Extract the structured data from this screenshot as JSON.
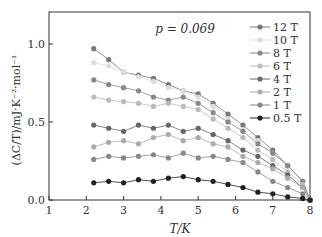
{
  "chart_data": {
    "type": "line",
    "title": "",
    "annotation": "p = 0.069",
    "xlabel": "T/K",
    "ylabel": "(ΔC/T)/mJ·K⁻²·mol⁻¹",
    "xlim": [
      1,
      8
    ],
    "ylim": [
      0,
      1.2
    ],
    "xticks": [
      "1",
      "2",
      "3",
      "4",
      "5",
      "6",
      "7",
      "8"
    ],
    "yticks": [
      "0.0",
      "0.5",
      "1.0"
    ],
    "legend_position": "upper right",
    "x": [
      2.2,
      2.6,
      3.0,
      3.4,
      3.8,
      4.2,
      4.6,
      5.0,
      5.4,
      5.8,
      6.2,
      6.6,
      7.0,
      7.4,
      7.8,
      8.0
    ],
    "series": [
      {
        "name": "12 T",
        "color": "#777777",
        "marker": "circle",
        "values": [
          0.97,
          0.9,
          0.82,
          0.8,
          0.78,
          0.74,
          0.7,
          0.68,
          0.62,
          0.55,
          0.48,
          0.4,
          0.32,
          0.22,
          0.12,
          0.0
        ]
      },
      {
        "name": "10 T",
        "color": "#dddddd",
        "marker": "tri-right",
        "values": [
          0.88,
          0.86,
          0.82,
          0.79,
          0.76,
          0.72,
          0.7,
          0.66,
          0.6,
          0.52,
          0.45,
          0.38,
          0.3,
          0.22,
          0.12,
          0.0
        ]
      },
      {
        "name": "8 T",
        "color": "#888888",
        "marker": "tri-left",
        "values": [
          0.77,
          0.74,
          0.72,
          0.7,
          0.66,
          0.64,
          0.66,
          0.62,
          0.56,
          0.5,
          0.44,
          0.36,
          0.3,
          0.22,
          0.12,
          0.0
        ]
      },
      {
        "name": "6 T",
        "color": "#bbbbbb",
        "marker": "diamond",
        "values": [
          0.66,
          0.64,
          0.63,
          0.62,
          0.6,
          0.62,
          0.6,
          0.58,
          0.52,
          0.46,
          0.4,
          0.32,
          0.26,
          0.18,
          0.1,
          0.0
        ]
      },
      {
        "name": "4 T",
        "color": "#666666",
        "marker": "tri-down",
        "values": [
          0.48,
          0.46,
          0.44,
          0.48,
          0.46,
          0.48,
          0.44,
          0.46,
          0.42,
          0.38,
          0.32,
          0.28,
          0.22,
          0.16,
          0.08,
          0.0
        ]
      },
      {
        "name": "2 T",
        "color": "#aaaaaa",
        "marker": "tri-up",
        "values": [
          0.34,
          0.37,
          0.38,
          0.36,
          0.4,
          0.42,
          0.38,
          0.4,
          0.36,
          0.34,
          0.28,
          0.24,
          0.2,
          0.14,
          0.08,
          0.0
        ]
      },
      {
        "name": "1 T",
        "color": "#888888",
        "marker": "circle",
        "values": [
          0.26,
          0.28,
          0.27,
          0.28,
          0.29,
          0.27,
          0.3,
          0.27,
          0.28,
          0.26,
          0.24,
          0.18,
          0.12,
          0.08,
          0.04,
          0.0
        ]
      },
      {
        "name": "0.5 T",
        "color": "#222222",
        "marker": "square",
        "values": [
          0.11,
          0.12,
          0.11,
          0.13,
          0.12,
          0.14,
          0.15,
          0.13,
          0.12,
          0.1,
          0.08,
          0.05,
          0.04,
          0.02,
          0.01,
          0.0
        ]
      }
    ]
  }
}
